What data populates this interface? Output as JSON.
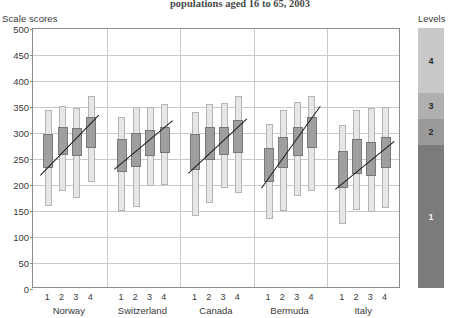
{
  "chart_title": "populations aged 16 to 65, 2003",
  "y_axis_caption": "Scale scores",
  "legend_caption": "Levels",
  "chart_data": {
    "type": "bar",
    "title": "populations aged 16 to 65, 2003",
    "xlabel": "",
    "ylabel": "Scale scores",
    "ylim": [
      0,
      500
    ],
    "yticks": [
      0,
      50,
      100,
      150,
      200,
      250,
      300,
      350,
      400,
      450,
      500
    ],
    "grid": true,
    "legend_position": "right",
    "legend_title": "Levels",
    "legend_entries": [
      {
        "label": "4",
        "color": "#c9c9c9",
        "range": [
          375,
          500
        ]
      },
      {
        "label": "3",
        "color": "#b0b0b0",
        "range": [
          325,
          375
        ]
      },
      {
        "label": "2",
        "color": "#9a9a9a",
        "range": [
          275,
          325
        ]
      },
      {
        "label": "1",
        "color": "#7b7b7b",
        "range": [
          0,
          275
        ]
      }
    ],
    "categories": [
      "Norway",
      "Switzerland",
      "Canada",
      "Bermuda",
      "Italy"
    ],
    "domain_labels": [
      "1",
      "2",
      "3",
      "4"
    ],
    "series_description": "Outer light bar = 5th to 95th percentile range; inner dark box = 25th to 75th percentile; line = mean trend across domains",
    "groups": [
      {
        "country": "Norway",
        "trend": [
          235,
          320
        ],
        "bars": [
          {
            "domain": "1",
            "p5": 160,
            "p95": 345,
            "p25": 232,
            "p75": 298,
            "mean": 265
          },
          {
            "domain": "2",
            "p5": 188,
            "p95": 352,
            "p25": 258,
            "p75": 312,
            "mean": 285
          },
          {
            "domain": "3",
            "p5": 175,
            "p95": 348,
            "p25": 255,
            "p75": 310,
            "mean": 283
          },
          {
            "domain": "4",
            "p5": 205,
            "p95": 372,
            "p25": 272,
            "p75": 330,
            "mean": 300
          }
        ]
      },
      {
        "country": "Switzerland",
        "trend": [
          243,
          312
        ],
        "bars": [
          {
            "domain": "1",
            "p5": 150,
            "p95": 330,
            "p25": 225,
            "p75": 288,
            "mean": 258
          },
          {
            "domain": "2",
            "p5": 158,
            "p95": 350,
            "p25": 235,
            "p75": 300,
            "mean": 268
          },
          {
            "domain": "3",
            "p5": 198,
            "p95": 350,
            "p25": 255,
            "p75": 305,
            "mean": 282
          },
          {
            "domain": "4",
            "p5": 200,
            "p95": 355,
            "p25": 262,
            "p75": 312,
            "mean": 288
          }
        ]
      },
      {
        "country": "Canada",
        "trend": [
          238,
          315
        ],
        "bars": [
          {
            "domain": "1",
            "p5": 140,
            "p95": 340,
            "p25": 228,
            "p75": 298,
            "mean": 262
          },
          {
            "domain": "2",
            "p5": 165,
            "p95": 355,
            "p25": 248,
            "p75": 312,
            "mean": 280
          },
          {
            "domain": "3",
            "p5": 195,
            "p95": 358,
            "p25": 258,
            "p75": 312,
            "mean": 285
          },
          {
            "domain": "4",
            "p5": 185,
            "p95": 372,
            "p25": 262,
            "p75": 325,
            "mean": 293
          }
        ]
      },
      {
        "country": "Bermuda",
        "trend": [
          215,
          330
        ],
        "bars": [
          {
            "domain": "1",
            "p5": 135,
            "p95": 318,
            "p25": 205,
            "p75": 272,
            "mean": 238
          },
          {
            "domain": "2",
            "p5": 150,
            "p95": 345,
            "p25": 232,
            "p75": 292,
            "mean": 262
          },
          {
            "domain": "3",
            "p5": 178,
            "p95": 360,
            "p25": 255,
            "p75": 312,
            "mean": 283
          },
          {
            "domain": "4",
            "p5": 188,
            "p95": 372,
            "p25": 272,
            "p75": 330,
            "mean": 300
          }
        ]
      },
      {
        "country": "Italy",
        "trend": [
          205,
          272
        ],
        "bars": [
          {
            "domain": "1",
            "p5": 125,
            "p95": 315,
            "p25": 195,
            "p75": 265,
            "mean": 228
          },
          {
            "domain": "2",
            "p5": 152,
            "p95": 345,
            "p25": 222,
            "p75": 288,
            "mean": 252
          },
          {
            "domain": "3",
            "p5": 148,
            "p95": 348,
            "p25": 218,
            "p75": 282,
            "mean": 248
          },
          {
            "domain": "4",
            "p5": 155,
            "p95": 350,
            "p25": 232,
            "p75": 292,
            "mean": 260
          }
        ]
      }
    ]
  }
}
